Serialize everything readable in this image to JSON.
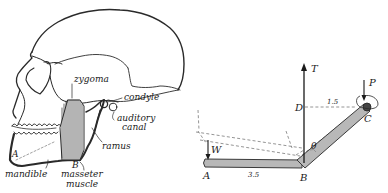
{
  "figure": {
    "left_panel": {
      "subject": "human skull, side view",
      "labels": {
        "zygoma": "zygoma",
        "condyle": "condyle",
        "auditory_canal_line1": "auditory",
        "auditory_canal_line2": "canal",
        "ramus": "ramus",
        "mandible": "mandible",
        "masseter_line1": "masseter",
        "masseter_line2": "muscle",
        "point_a": "A",
        "point_b": "B"
      }
    },
    "right_panel": {
      "subject": "bent lever model of the jaw",
      "labels": {
        "tension": "T",
        "force_p": "P",
        "weight": "W",
        "point_a": "A",
        "point_b": "B",
        "point_c": "C",
        "point_d": "D",
        "angle": "θ",
        "length_ab": "3.5",
        "length_dc": "1.5"
      }
    },
    "colors": {
      "ink": "#1a1a1a",
      "lever_fill": "#b8b8b8",
      "lever_edge": "#3a3a3a",
      "dashed": "#7a7a7a"
    }
  }
}
